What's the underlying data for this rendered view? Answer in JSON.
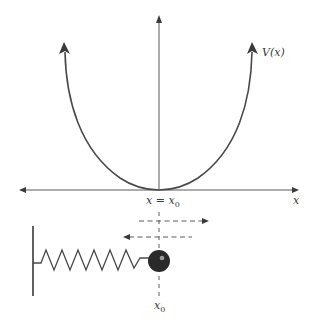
{
  "graph": {
    "curve_label": "V(x)",
    "x_axis_label": "x",
    "equilibrium_label": "x = x",
    "equilibrium_subscript": "0",
    "curve_shape": "parabola",
    "vertex": "x = x0"
  },
  "spring_system": {
    "equilibrium_label": "x",
    "equilibrium_subscript": "0",
    "motion_arrows": [
      "right",
      "left"
    ],
    "components": [
      "wall",
      "spring",
      "mass"
    ]
  },
  "colors": {
    "line": "#4a4a4a",
    "axis": "#5a5a5a",
    "ball": "#2a2a2a",
    "ball_highlight": "#9a9a9a",
    "background": "#ffffff"
  }
}
